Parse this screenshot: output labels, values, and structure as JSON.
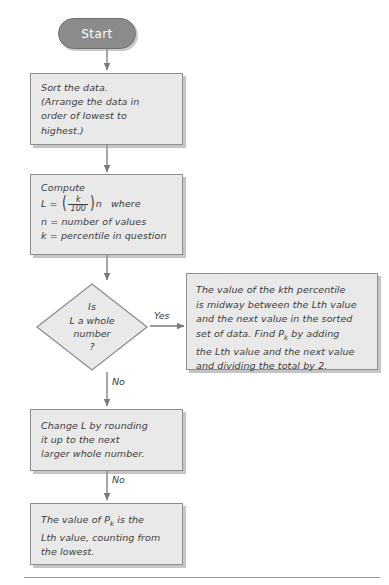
{
  "diagram": {
    "colors": {
      "node_fill": "#e9e9e9",
      "node_border": "#8e8e8e",
      "terminator_fill": "#8b8b8b",
      "terminator_text": "#ffffff",
      "connector": "#7a7a7a",
      "text": "#3c3c3c",
      "background": "#ffffff"
    },
    "nodes": {
      "start": {
        "type": "terminator",
        "label": "Start"
      },
      "sort": {
        "type": "process",
        "lines": [
          "Sort the data.",
          "(Arrange the data in",
          "order of lowest to",
          "highest.)"
        ]
      },
      "compute": {
        "type": "process",
        "heading": "Compute",
        "formula": {
          "lhs": "L",
          "equals": "=",
          "numerator": "k",
          "denominator": "100",
          "multiplier": "n",
          "trailing": "where"
        },
        "lines": [
          "n = number of values",
          "k = percentile in question"
        ],
        "definition_n": {
          "symbol": "n",
          "equals": "=",
          "text": "number of values"
        },
        "definition_k": {
          "symbol": "k",
          "equals": "=",
          "text": "percentile in question"
        }
      },
      "decision": {
        "type": "decision",
        "lines": [
          "Is",
          "L a whole",
          "number",
          "?"
        ]
      },
      "yes_result": {
        "type": "process",
        "lines": [
          "The value of the kth percentile",
          "is midway between the Lth value",
          "and the next value in the sorted",
          "set of data. Find Pk by adding",
          "the Lth value and the next value",
          "and dividing the total by 2."
        ]
      },
      "round_up": {
        "type": "process",
        "lines": [
          "Change L by rounding",
          "it up to the next",
          "larger whole number."
        ]
      },
      "final_result": {
        "type": "process",
        "lines": [
          "The value of Pk is the",
          "Lth value, counting from",
          "the lowest."
        ]
      }
    },
    "edges": [
      {
        "from": "start",
        "to": "sort",
        "label": ""
      },
      {
        "from": "sort",
        "to": "compute",
        "label": ""
      },
      {
        "from": "compute",
        "to": "decision",
        "label": ""
      },
      {
        "from": "decision",
        "to": "yes_result",
        "label": "Yes"
      },
      {
        "from": "decision",
        "to": "round_up",
        "label": "No"
      },
      {
        "from": "round_up",
        "to": "final_result",
        "label": "No"
      }
    ],
    "edge_labels": {
      "yes": "Yes",
      "no_decision": "No",
      "no_roundup": "No"
    }
  }
}
